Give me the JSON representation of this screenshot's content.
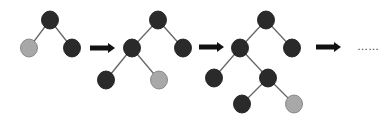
{
  "diagram": {
    "colors": {
      "dark_node": "#2a2a2a",
      "leaf_node": "#a8a8a8",
      "edge": "#666666",
      "arrow": "#111111"
    },
    "node_radius": 8.5,
    "trees": [
      {
        "id": "tree-1",
        "nodes": [
          {
            "id": "t1-root",
            "x": 50,
            "y": 20,
            "type": "dark"
          },
          {
            "id": "t1-l",
            "x": 29,
            "y": 48,
            "type": "leaf"
          },
          {
            "id": "t1-r",
            "x": 72,
            "y": 48,
            "type": "dark"
          }
        ],
        "edges": [
          [
            "t1-root",
            "t1-l"
          ],
          [
            "t1-root",
            "t1-r"
          ]
        ]
      },
      {
        "id": "tree-2",
        "nodes": [
          {
            "id": "t2-root",
            "x": 158,
            "y": 20,
            "type": "dark"
          },
          {
            "id": "t2-l",
            "x": 132,
            "y": 48,
            "type": "dark"
          },
          {
            "id": "t2-r",
            "x": 183,
            "y": 48,
            "type": "dark"
          },
          {
            "id": "t2-ll",
            "x": 106,
            "y": 80,
            "type": "dark"
          },
          {
            "id": "t2-lr",
            "x": 159,
            "y": 80,
            "type": "leaf"
          }
        ],
        "edges": [
          [
            "t2-root",
            "t2-l"
          ],
          [
            "t2-root",
            "t2-r"
          ],
          [
            "t2-l",
            "t2-ll"
          ],
          [
            "t2-l",
            "t2-lr"
          ]
        ]
      },
      {
        "id": "tree-3",
        "nodes": [
          {
            "id": "t3-root",
            "x": 266,
            "y": 20,
            "type": "dark"
          },
          {
            "id": "t3-l",
            "x": 240,
            "y": 48,
            "type": "dark"
          },
          {
            "id": "t3-r",
            "x": 292,
            "y": 48,
            "type": "dark"
          },
          {
            "id": "t3-ll",
            "x": 214,
            "y": 78,
            "type": "dark"
          },
          {
            "id": "t3-lr",
            "x": 268,
            "y": 78,
            "type": "dark"
          },
          {
            "id": "t3-lrl",
            "x": 242,
            "y": 104,
            "type": "dark"
          },
          {
            "id": "t3-lrr",
            "x": 294,
            "y": 104,
            "type": "leaf"
          }
        ],
        "edges": [
          [
            "t3-root",
            "t3-l"
          ],
          [
            "t3-root",
            "t3-r"
          ],
          [
            "t3-l",
            "t3-ll"
          ],
          [
            "t3-l",
            "t3-lr"
          ],
          [
            "t3-lr",
            "t3-lrl"
          ],
          [
            "t3-lr",
            "t3-lrr"
          ]
        ]
      }
    ],
    "arrows": [
      {
        "id": "arrow-1",
        "x1": 90,
        "x2": 115,
        "y": 48
      },
      {
        "id": "arrow-2",
        "x1": 199,
        "x2": 224,
        "y": 47
      },
      {
        "id": "arrow-3",
        "x1": 316,
        "x2": 341,
        "y": 47
      }
    ],
    "continuation": {
      "text": "……",
      "x": 357,
      "y": 40
    }
  }
}
